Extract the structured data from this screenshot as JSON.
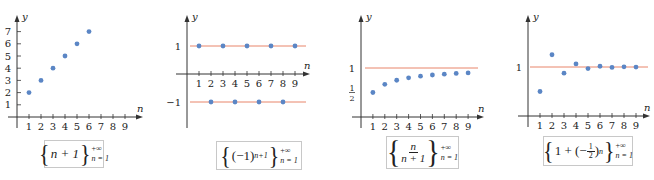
{
  "colors": {
    "axis": "#333333",
    "dot": "#5b86c5",
    "ref_line": "#e8856b",
    "caption_border": "#c8c8c8"
  },
  "chart_data": [
    {
      "type": "scatter",
      "title": "{n+1}_{n=1}^{+∞}",
      "xlabel": "n",
      "ylabel": "y",
      "x": [
        1,
        2,
        3,
        4,
        5,
        6
      ],
      "values": [
        2,
        3,
        4,
        5,
        6,
        7
      ],
      "x_ticks": [
        "1",
        "2",
        "3",
        "4",
        "5",
        "6",
        "7",
        "8",
        "9"
      ],
      "y_ticks": [
        "1",
        "2",
        "3",
        "4",
        "5",
        "6",
        "7"
      ],
      "xlim": [
        0,
        9
      ],
      "ylim": [
        0,
        7
      ],
      "reference_lines": [],
      "grid": false
    },
    {
      "type": "scatter",
      "title": "{(-1)^{n+1}}_{n=1}^{+∞}",
      "xlabel": "n",
      "ylabel": "y",
      "x": [
        1,
        2,
        3,
        4,
        5,
        6,
        7,
        8,
        9
      ],
      "values": [
        1,
        -1,
        1,
        -1,
        1,
        -1,
        1,
        -1,
        1
      ],
      "x_ticks": [
        "1",
        "2",
        "3",
        "4",
        "5",
        "6",
        "7",
        "8",
        "9"
      ],
      "y_ticks": [
        "1",
        "−1"
      ],
      "xlim": [
        0,
        9
      ],
      "ylim": [
        -1,
        1
      ],
      "reference_lines": [
        1,
        -1
      ],
      "grid": false
    },
    {
      "type": "scatter",
      "title": "{n/(n+1)}_{n=1}^{+∞}",
      "xlabel": "n",
      "ylabel": "y",
      "x": [
        1,
        2,
        3,
        4,
        5,
        6,
        7,
        8,
        9
      ],
      "values": [
        0.5,
        0.667,
        0.75,
        0.8,
        0.833,
        0.857,
        0.875,
        0.889,
        0.9
      ],
      "x_ticks": [
        "1",
        "2",
        "3",
        "4",
        "5",
        "6",
        "7",
        "8",
        "9"
      ],
      "y_ticks": [
        "1/2",
        "1"
      ],
      "xlim": [
        0,
        9
      ],
      "ylim": [
        0,
        1
      ],
      "reference_lines": [
        1
      ],
      "grid": false
    },
    {
      "type": "scatter",
      "title": "{1+(−1/2)^n}_{n=1}^{+∞}",
      "xlabel": "n",
      "ylabel": "y",
      "x": [
        1,
        2,
        3,
        4,
        5,
        6,
        7,
        8,
        9
      ],
      "values": [
        0.5,
        1.25,
        0.875,
        1.0625,
        0.96875,
        1.015625,
        0.9921875,
        1.00390625,
        0.998046875
      ],
      "x_ticks": [
        "1",
        "2",
        "3",
        "4",
        "5",
        "6",
        "7",
        "8",
        "9"
      ],
      "y_ticks": [
        "1"
      ],
      "xlim": [
        0,
        9
      ],
      "ylim": [
        0,
        1.25
      ],
      "reference_lines": [
        1
      ],
      "grid": false
    }
  ],
  "captions": [
    {
      "body": "n + 1",
      "upper": "+∞",
      "lower": "n = 1"
    },
    {
      "base": "(−1)",
      "exp": "n+1",
      "upper": "+∞",
      "lower": "n = 1"
    },
    {
      "num": "n",
      "den": "n + 1",
      "upper": "+∞",
      "lower": "n = 1"
    },
    {
      "pre": "1 + (−",
      "fnum": "1",
      "fden": "2",
      "post": ")",
      "exp": "n",
      "upper": "+∞",
      "lower": "n = 1"
    }
  ],
  "layout": [
    {
      "ox": 17,
      "oy": 117,
      "sx": 12,
      "sy": 12.2,
      "ytop": 15,
      "ybot": 128,
      "xend": 143,
      "xstart": 8,
      "ref_x0": 17,
      "ref_x1": 143,
      "cap": [
        44,
        140,
        60,
        28
      ]
    },
    {
      "ox": 187,
      "oy": 74,
      "sx": 12,
      "sy": 28,
      "ytop": 15,
      "ybot": 128,
      "xend": 310,
      "xstart": 176,
      "ref_x0": 190,
      "ref_x1": 306,
      "cap": [
        216,
        141,
        86,
        29
      ]
    },
    {
      "ox": 361,
      "oy": 117,
      "sx": 11.9,
      "sy": 49,
      "ytop": 15,
      "ybot": 128,
      "xend": 484,
      "xstart": 352,
      "ref_x0": 365,
      "ref_x1": 478,
      "cap": [
        386,
        136,
        73,
        33
      ]
    },
    {
      "ox": 528,
      "oy": 116,
      "sx": 12,
      "sy": 49,
      "ytop": 15,
      "ybot": 127,
      "xend": 650,
      "xstart": 518,
      "ref_x0": 530,
      "ref_x1": 648,
      "cap": [
        543,
        136,
        90,
        30
      ]
    }
  ]
}
